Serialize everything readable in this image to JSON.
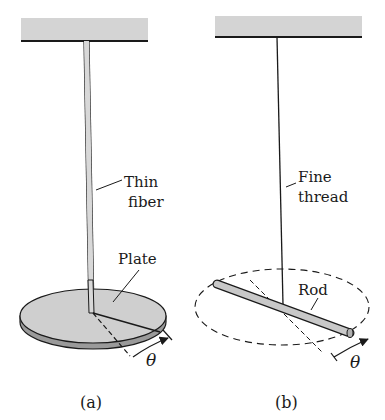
{
  "figure": {
    "panel_a": {
      "caption": "(a)",
      "labels": {
        "fiber_line1": "Thin",
        "fiber_line2": "fiber",
        "plate": "Plate",
        "angle": "θ"
      }
    },
    "panel_b": {
      "caption": "(b)",
      "labels": {
        "thread_line1": "Fine",
        "thread_line2": "thread",
        "rod": "Rod",
        "angle": "θ"
      }
    },
    "colors": {
      "ceiling": "#d4d4d4",
      "plate": "#cfcfcf",
      "plate_edge": "#9a9a9a",
      "rod": "#c8c8c8",
      "ink": "#1a1a1a"
    }
  }
}
